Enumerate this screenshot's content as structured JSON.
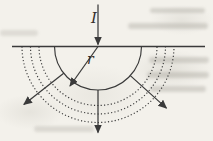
{
  "figure": {
    "labels": {
      "current": "I",
      "radius": "r"
    },
    "ink_color": "#3a3a3a",
    "paper_color": "#f3f1eb",
    "geometry": {
      "canvas": {
        "width": 213,
        "height": 141
      },
      "surface_line": {
        "x1": 12,
        "y1": 46.5,
        "x2": 205,
        "y2": 46.5
      },
      "source_point": {
        "x": 98,
        "y": 46.5
      },
      "current_arrow": {
        "x1": 98,
        "y1": 4.5,
        "x2": 98,
        "y2": 44.5
      },
      "radius_arrow": {
        "x1": 98,
        "y1": 46.5,
        "x2": 70,
        "y2": 86
      },
      "shells": [
        {
          "radius": 43.5,
          "style": "solid"
        },
        {
          "radius": 59,
          "style": "dotted"
        },
        {
          "radius": 67.5,
          "style": "dotted"
        },
        {
          "radius": 76,
          "style": "dotted"
        }
      ],
      "flow_arrows": [
        {
          "angle_deg": 142,
          "r_start": 43.5,
          "r_end": 94
        },
        {
          "angle_deg": 90,
          "r_start": 43.5,
          "r_end": 86
        },
        {
          "angle_deg": 42,
          "r_start": 43.5,
          "r_end": 92
        }
      ]
    }
  }
}
